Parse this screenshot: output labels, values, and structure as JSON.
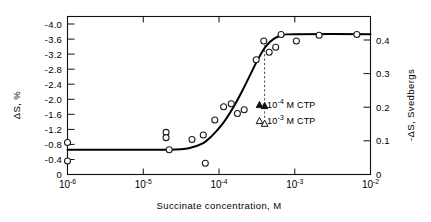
{
  "chart_data": {
    "type": "scatter",
    "title": "",
    "xlabel": "Succinate concentration, M",
    "ylabel_left": "ΔS, %",
    "ylabel_right": "-ΔS, Svedbergs",
    "xscale": "log",
    "xlim": [
      3.2e-07,
      0.02
    ],
    "ylim_left": [
      0,
      -4.2
    ],
    "ylim_right": [
      0,
      0.44
    ],
    "grid": false,
    "legend_position": "none",
    "xticks": [
      "10⁻⁶",
      "10⁻⁵",
      "10⁻⁴",
      "10⁻³",
      "10⁻²"
    ],
    "xtick_values": [
      1e-06,
      1e-05,
      0.0001,
      0.001,
      0.01
    ],
    "xtick_bases": [
      "10",
      "10",
      "10",
      "10",
      "10"
    ],
    "xtick_exponents": [
      "-6",
      "-5",
      "-4",
      "-3",
      "-2"
    ],
    "yticks_left": [
      "-4.0",
      "-3.6",
      "-3.2",
      "-2.8",
      "-2.4",
      "-2.0",
      "-1.6",
      "-1.2",
      "-0.8",
      "-0.4",
      "0"
    ],
    "ytick_left_values": [
      -4.0,
      -3.6,
      -3.2,
      -2.8,
      -2.4,
      -2.0,
      -1.6,
      -1.2,
      -0.8,
      -0.4,
      0
    ],
    "yticks_right": [
      "0.4",
      "0.3",
      "0.2",
      "0.1",
      "0"
    ],
    "ytick_right_values": [
      0.4,
      0.3,
      0.2,
      0.1,
      0
    ],
    "series": [
      {
        "name": "Succinate titration",
        "marker": "open-circle",
        "points": [
          {
            "x": 1e-06,
            "y": -0.85
          },
          {
            "x": 1e-06,
            "y": -0.36
          },
          {
            "x": 2e-05,
            "y": -1.12
          },
          {
            "x": 2e-05,
            "y": -0.98
          },
          {
            "x": 2.2e-05,
            "y": -0.66
          },
          {
            "x": 4.4e-05,
            "y": -0.93
          },
          {
            "x": 6.2e-05,
            "y": -1.05
          },
          {
            "x": 6.6e-05,
            "y": -0.3
          },
          {
            "x": 8.8e-05,
            "y": -1.45
          },
          {
            "x": 0.000115,
            "y": -1.8
          },
          {
            "x": 0.000145,
            "y": -1.88
          },
          {
            "x": 0.000175,
            "y": -1.62
          },
          {
            "x": 0.000215,
            "y": -1.72
          },
          {
            "x": 0.00031,
            "y": -3.05
          },
          {
            "x": 0.00039,
            "y": -3.55
          },
          {
            "x": 0.00046,
            "y": -3.25
          },
          {
            "x": 0.00056,
            "y": -3.38
          },
          {
            "x": 0.00066,
            "y": -3.72
          },
          {
            "x": 0.00105,
            "y": -3.55
          },
          {
            "x": 0.0021,
            "y": -3.7
          },
          {
            "x": 0.0066,
            "y": -3.72
          }
        ]
      },
      {
        "name": "10-4 M CTP",
        "marker": "filled-triangle",
        "points": [
          {
            "x": 0.0004,
            "y": -1.82
          }
        ]
      },
      {
        "name": "10-3 M CTP",
        "marker": "open-triangle",
        "points": [
          {
            "x": 0.0004,
            "y": -1.35
          }
        ]
      }
    ],
    "fit_curve": {
      "description": "sigmoid fit of delta-S vs log succinate concentration",
      "points": [
        {
          "x": 1e-06,
          "y": -0.66
        },
        {
          "x": 1e-05,
          "y": -0.66
        },
        {
          "x": 2.2e-05,
          "y": -0.66
        },
        {
          "x": 4e-05,
          "y": -0.7
        },
        {
          "x": 6e-05,
          "y": -0.82
        },
        {
          "x": 8e-05,
          "y": -1.02
        },
        {
          "x": 0.00011,
          "y": -1.33
        },
        {
          "x": 0.00015,
          "y": -1.74
        },
        {
          "x": 0.0002,
          "y": -2.2
        },
        {
          "x": 0.00026,
          "y": -2.66
        },
        {
          "x": 0.00033,
          "y": -3.08
        },
        {
          "x": 0.00042,
          "y": -3.42
        },
        {
          "x": 0.00054,
          "y": -3.62
        },
        {
          "x": 0.0007,
          "y": -3.7
        },
        {
          "x": 0.001,
          "y": -3.73
        },
        {
          "x": 0.01,
          "y": -3.73
        }
      ]
    },
    "annotations": [
      {
        "marker": "filled-triangle",
        "label_base": "10",
        "label_exp": "-4",
        "label_tail": " M CTP"
      },
      {
        "marker": "open-triangle",
        "label_base": "10",
        "label_exp": "-3",
        "label_tail": " M CTP"
      }
    ],
    "dropline": {
      "from": {
        "x": 0.0004,
        "y": -3.55
      },
      "to": {
        "x": 0.0004,
        "y": -1.28
      },
      "style": "dashed"
    }
  }
}
